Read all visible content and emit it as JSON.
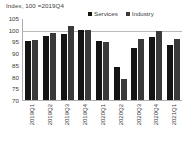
{
  "chart_data": {
    "type": "bar",
    "title": "Index, 100 =2019Q4",
    "xlabel": "",
    "ylabel": "",
    "ylim": [
      70,
      105
    ],
    "yticks": [
      105,
      100,
      95,
      90,
      85,
      80,
      75,
      70
    ],
    "grid": true,
    "legend_position": "top-right",
    "reference_line": 100,
    "categories": [
      "2019Q1",
      "2019Q2",
      "2019Q3",
      "2019Q4",
      "2020Q1",
      "2020Q2",
      "2020Q3",
      "2020Q4",
      "2021Q1"
    ],
    "series": [
      {
        "name": "Services",
        "color": "#141414",
        "values": [
          95.0,
          97.5,
          98.0,
          100.0,
          95.0,
          84.0,
          92.0,
          97.0,
          93.5
        ]
      },
      {
        "name": "Industry",
        "color": "#3a3a3a",
        "values": [
          95.5,
          98.5,
          101.5,
          100.0,
          94.8,
          79.0,
          96.0,
          99.5,
          96.0
        ]
      }
    ]
  }
}
